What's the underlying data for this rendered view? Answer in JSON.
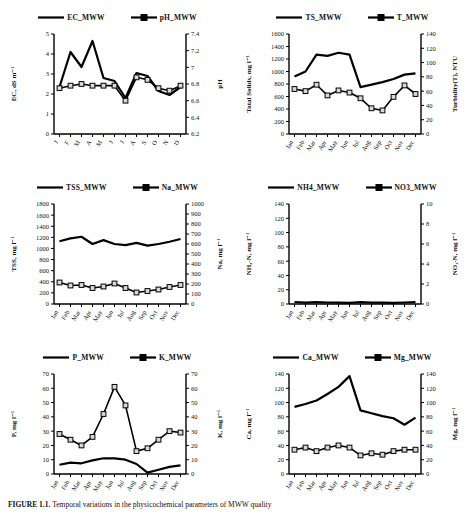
{
  "figure": {
    "caption_prefix": "FIGURE 1.1. ",
    "caption_text": "Temporal variations in the physicochemical parameters of MWW quality"
  },
  "months_long": [
    "Jan",
    "Feb",
    "Mar",
    "Apr",
    "May",
    "Jun",
    "Jul",
    "Aug",
    "Sep",
    "Oct",
    "Nov",
    "Dec"
  ],
  "months_short": [
    "J",
    "F",
    "M",
    "A",
    "M",
    "J",
    "J",
    "A",
    "S",
    "O",
    "N",
    "D"
  ],
  "series_colors": {
    "primary": "#000000",
    "secondary": "#000000"
  },
  "chart_data": [
    {
      "id": "ec-ph",
      "type": "line",
      "title": "",
      "xlabel": "",
      "categories": [
        "J",
        "F",
        "M",
        "A",
        "M",
        "J",
        "J",
        "A",
        "S",
        "O",
        "N",
        "D"
      ],
      "ylabel": "EC, dS m⁻¹",
      "ylim": [
        0,
        5
      ],
      "yticks": [
        0,
        1,
        2,
        3,
        4,
        5
      ],
      "y2label": "pH",
      "y2lim": [
        6.2,
        7.4
      ],
      "y2ticks": [
        6.2,
        6.4,
        6.6,
        6.8,
        7,
        7.2,
        7.4
      ],
      "grid": false,
      "legend_position": "top",
      "series": [
        {
          "name": "EC_MWW",
          "axis": "left",
          "marker": "none",
          "values": [
            2.35,
            4.1,
            3.35,
            4.65,
            2.8,
            2.65,
            1.8,
            3.05,
            2.9,
            2.15,
            1.95,
            2.35
          ]
        },
        {
          "name": "pH_MWW",
          "axis": "right",
          "marker": "square",
          "values": [
            6.75,
            6.78,
            6.8,
            6.78,
            6.78,
            6.78,
            6.6,
            6.88,
            6.85,
            6.75,
            6.72,
            6.78
          ]
        }
      ]
    },
    {
      "id": "ts-turbidity",
      "type": "line",
      "title": "",
      "xlabel": "",
      "categories": [
        "Jan",
        "Feb",
        "Mar",
        "Apr",
        "May",
        "Jun",
        "Jul",
        "Aug",
        "Sep",
        "Oct",
        "Nov",
        "Dec"
      ],
      "ylabel": "Total Solids, mg l⁻¹",
      "ylim": [
        0,
        1600
      ],
      "yticks": [
        0,
        200,
        400,
        600,
        800,
        1000,
        1200,
        1400,
        1600
      ],
      "y2label": "Turbidity(T), NTU",
      "y2lim": [
        0,
        140
      ],
      "y2ticks": [
        0,
        20,
        40,
        60,
        80,
        100,
        120,
        140
      ],
      "grid": false,
      "legend_position": "top",
      "series": [
        {
          "name": "TS_MWW",
          "axis": "left",
          "marker": "none",
          "values": [
            920,
            1000,
            1270,
            1250,
            1300,
            1270,
            750,
            790,
            830,
            880,
            950,
            970
          ]
        },
        {
          "name": "T_MWW",
          "axis": "right",
          "marker": "square",
          "values": [
            63,
            60,
            69,
            54,
            61,
            58,
            50,
            36,
            33,
            52,
            68,
            56
          ]
        }
      ]
    },
    {
      "id": "tss-na",
      "type": "line",
      "title": "",
      "xlabel": "",
      "categories": [
        "Jan",
        "Feb",
        "Mar",
        "Apr",
        "May",
        "Jun",
        "Jul",
        "Aug",
        "Sep",
        "Oct",
        "Nov",
        "Dec"
      ],
      "ylabel": "TSS, mg l⁻¹",
      "ylim": [
        0,
        1800
      ],
      "yticks": [
        0,
        200,
        400,
        600,
        800,
        1000,
        1200,
        1400,
        1600,
        1800
      ],
      "y2label": "Na, mg l⁻¹",
      "y2lim": [
        0,
        1000
      ],
      "y2ticks": [
        0,
        100,
        200,
        300,
        400,
        500,
        600,
        700,
        800,
        900,
        1000
      ],
      "grid": false,
      "legend_position": "top",
      "series": [
        {
          "name": "TSS_MWW",
          "axis": "left",
          "marker": "none",
          "values": [
            1130,
            1180,
            1210,
            1080,
            1150,
            1080,
            1060,
            1100,
            1050,
            1080,
            1120,
            1170
          ]
        },
        {
          "name": "Na_MWW",
          "axis": "right",
          "marker": "square",
          "values": [
            215,
            185,
            190,
            160,
            175,
            205,
            160,
            115,
            130,
            145,
            170,
            190
          ]
        }
      ]
    },
    {
      "id": "nh4-no3",
      "type": "line",
      "title": "",
      "xlabel": "",
      "categories": [
        "Jan",
        "Feb",
        "Mar",
        "Apr",
        "May",
        "Jun",
        "Jul",
        "Aug",
        "Sep",
        "Oct",
        "Nov",
        "Dec"
      ],
      "ylabel": "NH₄-N, mg l⁻¹",
      "ylim": [
        0,
        140
      ],
      "yticks": [
        0,
        20,
        40,
        60,
        80,
        100,
        120,
        140
      ],
      "y2label": "NO₃-N, mg l⁻¹",
      "y2lim": [
        0,
        10
      ],
      "y2ticks": [
        0,
        2,
        4,
        6,
        8,
        10
      ],
      "grid": false,
      "legend_position": "top",
      "series": [
        {
          "name": "NH4_MWW",
          "axis": "left",
          "marker": "none",
          "values": [
            2.8,
            1.85,
            2.7,
            2.1,
            1.95,
            1.7,
            2.5,
            2.0,
            1.85,
            1.6,
            2.1,
            2.5
          ]
        },
        {
          "name": "NO3_MWW",
          "axis": "right",
          "marker": "square",
          "values": [
            93,
            117,
            72,
            91,
            71,
            70,
            63,
            46,
            52,
            59,
            86,
            105
          ]
        }
      ]
    },
    {
      "id": "p-k",
      "type": "line",
      "title": "",
      "xlabel": "",
      "categories": [
        "Jan",
        "Feb",
        "Mar",
        "Apr",
        "May",
        "Jun",
        "Jul",
        "Aug",
        "Sep",
        "Oct",
        "Nov",
        "Dec"
      ],
      "ylabel": "P, mg l⁻¹",
      "ylim": [
        0,
        70
      ],
      "yticks": [
        0,
        10,
        20,
        30,
        40,
        50,
        60,
        70
      ],
      "y2label": "K, mg l⁻¹",
      "y2lim": [
        0,
        70
      ],
      "y2ticks": [
        0,
        10,
        20,
        30,
        40,
        50,
        60,
        70
      ],
      "grid": false,
      "legend_position": "top",
      "series": [
        {
          "name": "P_MWW",
          "axis": "left",
          "marker": "none",
          "values": [
            6.5,
            8.0,
            7.5,
            9.5,
            11.0,
            11.0,
            10.0,
            7.0,
            1.0,
            3.0,
            5.0,
            6.0
          ]
        },
        {
          "name": "K_MWW",
          "axis": "right",
          "marker": "square",
          "values": [
            28,
            24,
            20,
            26,
            42,
            61,
            48,
            16,
            18,
            24,
            30,
            29
          ]
        }
      ]
    },
    {
      "id": "ca-mg",
      "type": "line",
      "title": "",
      "xlabel": "",
      "categories": [
        "Jan",
        "Feb",
        "Mar",
        "Apr",
        "May",
        "Jun",
        "Jul",
        "Aug",
        "Sep",
        "Oct",
        "Nov",
        "Dec"
      ],
      "ylabel": "Ca, mg l⁻¹",
      "ylim": [
        0,
        140
      ],
      "yticks": [
        0,
        20,
        40,
        60,
        80,
        100,
        120,
        140
      ],
      "y2label": "Mg, mg l⁻¹",
      "y2lim": [
        0,
        140
      ],
      "y2ticks": [
        0,
        20,
        40,
        60,
        80,
        100,
        120,
        140
      ],
      "grid": false,
      "legend_position": "top",
      "series": [
        {
          "name": "Ca_MWW",
          "axis": "left",
          "marker": "none",
          "values": [
            94,
            98,
            103,
            112,
            122,
            137,
            89,
            85,
            81,
            78,
            69,
            79
          ]
        },
        {
          "name": "Mg_MWW",
          "axis": "right",
          "marker": "square",
          "values": [
            34,
            37,
            32,
            37,
            40,
            37,
            26,
            29,
            27,
            32,
            34,
            34
          ]
        }
      ]
    }
  ]
}
